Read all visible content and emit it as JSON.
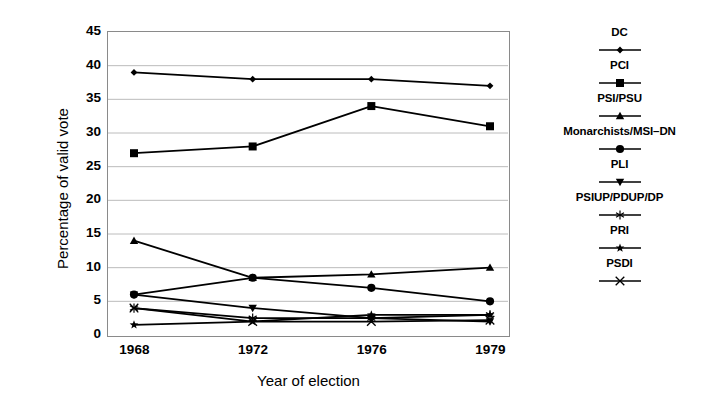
{
  "chart_data": {
    "type": "line",
    "title": "",
    "xlabel": "Year of election",
    "ylabel": "Percentage of valid vote",
    "categories": [
      "1968",
      "1972",
      "1976",
      "1979"
    ],
    "x": [
      1968,
      1972,
      1976,
      1979
    ],
    "ylim": [
      0,
      45
    ],
    "ytick_labels": [
      "0",
      "5",
      "10",
      "15",
      "20",
      "25",
      "30",
      "35",
      "40",
      "45"
    ],
    "yticks": [
      0,
      5,
      10,
      15,
      20,
      25,
      30,
      35,
      40,
      45
    ],
    "grid": "horizontal",
    "legend_position": "right",
    "series": [
      {
        "name": "DC",
        "marker": "diamond",
        "values": [
          39,
          38,
          38,
          37
        ]
      },
      {
        "name": "PCI",
        "marker": "square",
        "values": [
          27,
          28,
          34,
          31
        ]
      },
      {
        "name": "PSI/PSU",
        "marker": "triangle-up",
        "values": [
          14,
          8.5,
          9,
          10
        ]
      },
      {
        "name": "Monarchists/MSI–DN",
        "marker": "circle",
        "values": [
          6,
          8.5,
          7,
          5
        ]
      },
      {
        "name": "PLI",
        "marker": "triangle-down",
        "values": [
          6,
          4,
          2.5,
          2
        ]
      },
      {
        "name": "PSIUP/PDUP/DP",
        "marker": "asterisk",
        "values": [
          4,
          2.5,
          2.5,
          3
        ]
      },
      {
        "name": "PRI",
        "marker": "star",
        "values": [
          1.5,
          2,
          3,
          3
        ]
      },
      {
        "name": "PSDI",
        "marker": "x-cross",
        "values": [
          4,
          2,
          2,
          2.2
        ]
      }
    ],
    "colors": {
      "line": "#000000",
      "grid": "#b4b4b4",
      "axis": "#8a8a8a",
      "background": "#ffffff"
    }
  },
  "legend": {
    "entries": [
      {
        "label": "DC",
        "marker": "diamond"
      },
      {
        "label": "PCI",
        "marker": "square"
      },
      {
        "label": "PSI/PSU",
        "marker": "triangle-up"
      },
      {
        "label": "Monarchists/MSI–DN",
        "marker": "circle"
      },
      {
        "label": "PLI",
        "marker": "triangle-down"
      },
      {
        "label": "PSIUP/PDUP/DP",
        "marker": "asterisk"
      },
      {
        "label": "PRI",
        "marker": "star"
      },
      {
        "label": "PSDI",
        "marker": "x-cross"
      }
    ]
  }
}
